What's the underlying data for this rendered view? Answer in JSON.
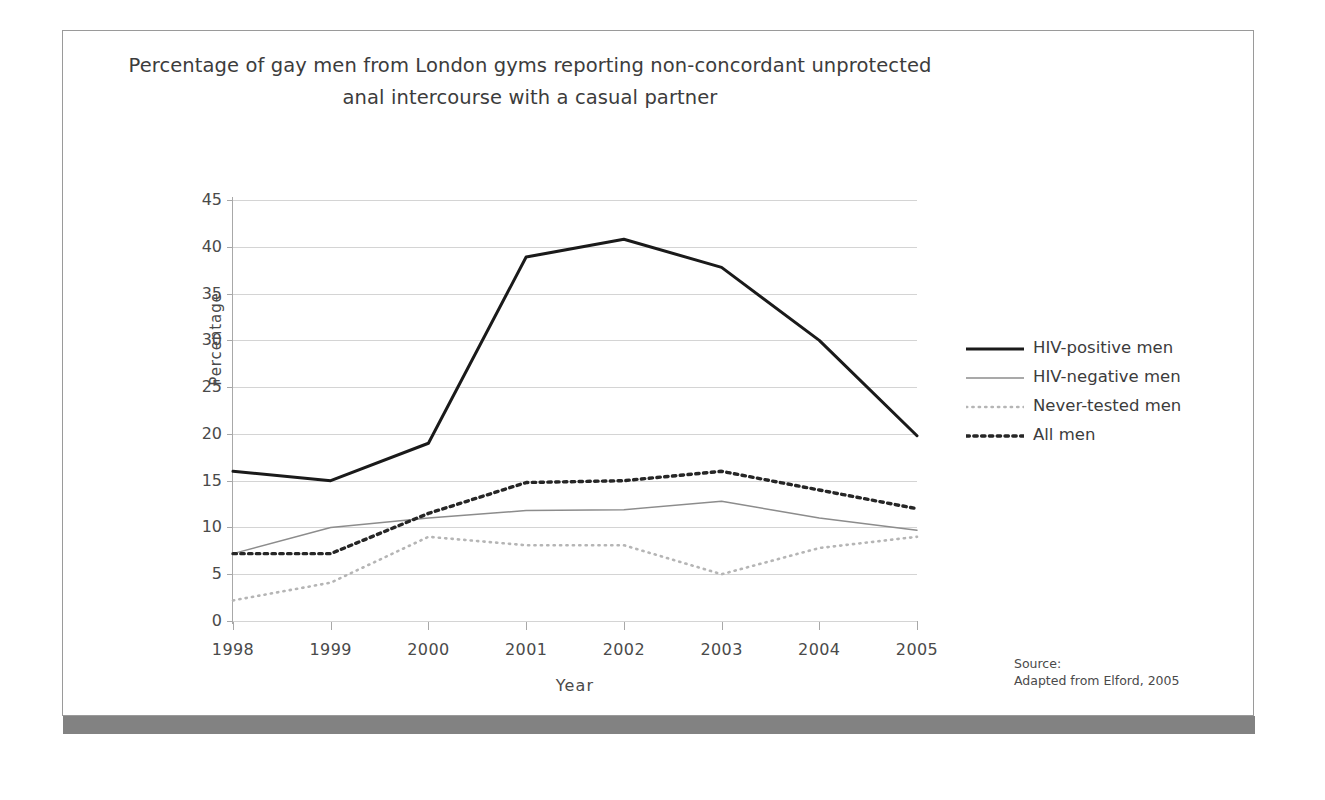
{
  "figure": {
    "title_line1": "Percentage of gay men from London gyms reporting non-concordant unprotected",
    "title_line2": "anal intercourse with a casual partner",
    "source_label": "Source:",
    "source_text": "Adapted from Elford, 2005"
  },
  "colors": {
    "hiv_positive": "#1a1a1a",
    "hiv_negative": "#8c8c8c",
    "never_tested": "#b5b5b5",
    "all_men": "#262626",
    "gridline": "#d4d4d4",
    "axis": "#a8a8a8",
    "text": "#3c3c3c",
    "frame": "#9a9a9a",
    "shadow_bar": "#828282"
  },
  "chart_data": {
    "type": "line",
    "title": "Percentage of gay men from London gyms reporting non-concordant unprotected anal intercourse with a casual partner",
    "xlabel": "Year",
    "ylabel": "Percentage",
    "categories": [
      "1998",
      "1999",
      "2000",
      "2001",
      "2002",
      "2003",
      "2004",
      "2005"
    ],
    "xlim": [
      "1998",
      "2005"
    ],
    "ylim": [
      0,
      45
    ],
    "yticks": [
      0,
      5,
      10,
      15,
      20,
      25,
      30,
      35,
      40,
      45
    ],
    "grid": "horizontal",
    "legend_position": "right",
    "series": [
      {
        "name": "HIV-positive men",
        "style": "solid",
        "color": "#1a1a1a",
        "values": [
          16,
          15,
          19,
          38.9,
          40.8,
          37.8,
          30,
          19.8
        ]
      },
      {
        "name": "HIV-negative men",
        "style": "thin-solid",
        "color": "#8c8c8c",
        "values": [
          7.2,
          10,
          11,
          11.8,
          11.9,
          12.8,
          11,
          9.7
        ]
      },
      {
        "name": "Never-tested men",
        "style": "fine-dotted",
        "color": "#b5b5b5",
        "values": [
          2.2,
          4.1,
          9,
          8.1,
          8.1,
          5,
          7.8,
          9
        ]
      },
      {
        "name": "All men",
        "style": "bold-dotted",
        "color": "#262626",
        "values": [
          7.2,
          7.2,
          11.5,
          14.8,
          15,
          16,
          14,
          12
        ]
      }
    ]
  }
}
